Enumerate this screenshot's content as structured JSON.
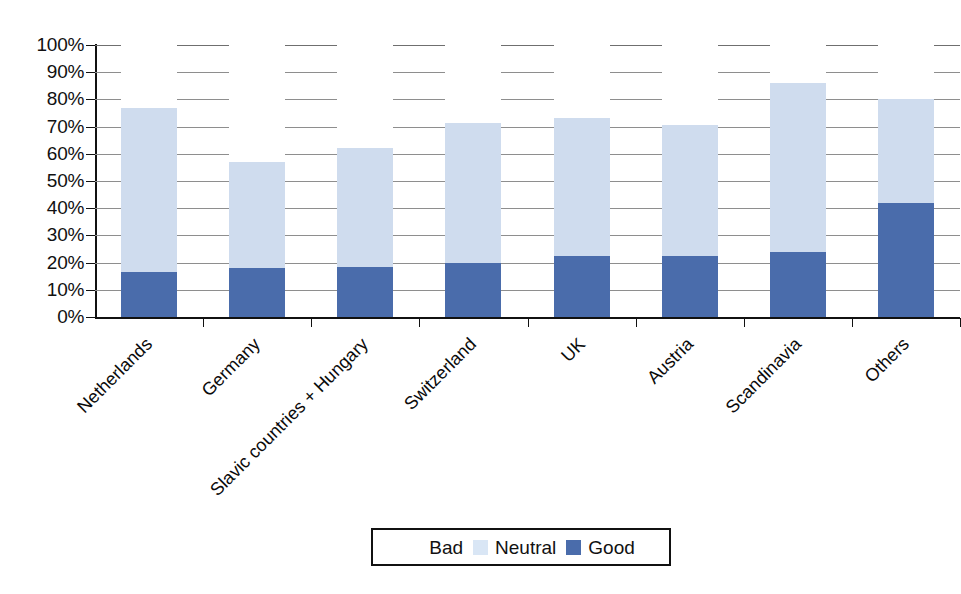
{
  "chart_data": {
    "type": "bar",
    "subtype": "stacked-100-percent",
    "title": "",
    "xlabel": "",
    "ylabel": "",
    "ylim": [
      0,
      100
    ],
    "ytick_labels": [
      "100%",
      "90%",
      "80%",
      "70%",
      "60%",
      "50%",
      "40%",
      "30%",
      "20%",
      "10%",
      "0%"
    ],
    "ytick_values": [
      100,
      90,
      80,
      70,
      60,
      50,
      40,
      30,
      20,
      10,
      0
    ],
    "grid": true,
    "legend_position": "bottom",
    "categories": [
      "Netherlands",
      "Germany",
      "Slavic countries + Hungary",
      "Switzerland",
      "UK",
      "Austria",
      "Scandinavia",
      "Others"
    ],
    "series": [
      {
        "name": "Good",
        "color": "#4a6cab",
        "values": [
          16.5,
          18.0,
          18.5,
          20.0,
          22.5,
          22.5,
          24.0,
          42.0
        ]
      },
      {
        "name": "Neutral",
        "color": "#cfdcee",
        "values": [
          60.5,
          39.0,
          43.5,
          51.5,
          50.5,
          48.0,
          62.0,
          38.0
        ]
      },
      {
        "name": "Bad",
        "color": "#ffffff",
        "values": [
          23.0,
          43.0,
          38.0,
          28.5,
          27.0,
          29.5,
          14.0,
          20.0
        ]
      }
    ],
    "cumulative_tops": {
      "good": [
        16.5,
        18.0,
        18.5,
        20.0,
        22.5,
        22.5,
        24.0,
        42.0
      ],
      "good_plus_neutral": [
        77.0,
        57.0,
        62.0,
        71.5,
        73.0,
        70.5,
        86.0,
        80.0
      ]
    }
  },
  "legend": {
    "items": [
      {
        "label": "Bad",
        "swatch_class": "sw-bad"
      },
      {
        "label": "Neutral",
        "swatch_class": "sw-neutral"
      },
      {
        "label": "Good",
        "swatch_class": "sw-good"
      }
    ]
  },
  "colors": {
    "good": "#4a6cab",
    "neutral": "#cfdcee",
    "bad": "#ffffff",
    "axis": "#111111",
    "gridline": "#8e8e8e",
    "background": "#ffffff"
  }
}
